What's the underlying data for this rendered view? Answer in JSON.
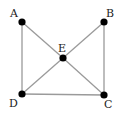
{
  "graph": {
    "nodes": [
      {
        "id": "A",
        "label": "A",
        "x": 22,
        "y": 22,
        "lx": 10,
        "ly": 17
      },
      {
        "id": "B",
        "label": "B",
        "x": 104,
        "y": 22,
        "lx": 106,
        "ly": 17
      },
      {
        "id": "C",
        "label": "C",
        "x": 104,
        "y": 95,
        "lx": 104,
        "ly": 108
      },
      {
        "id": "D",
        "label": "D",
        "x": 22,
        "y": 94,
        "lx": 9,
        "ly": 107
      },
      {
        "id": "E",
        "label": "E",
        "x": 63,
        "y": 58,
        "lx": 58,
        "ly": 52
      }
    ],
    "edges": [
      [
        "A",
        "D"
      ],
      [
        "A",
        "E"
      ],
      [
        "E",
        "C"
      ],
      [
        "B",
        "E"
      ],
      [
        "E",
        "D"
      ],
      [
        "B",
        "C"
      ],
      [
        "D",
        "C"
      ]
    ],
    "colors": {
      "edge": "#9a9a9a",
      "node": "#000000",
      "label": "#222222",
      "background": "#ffffff"
    }
  }
}
